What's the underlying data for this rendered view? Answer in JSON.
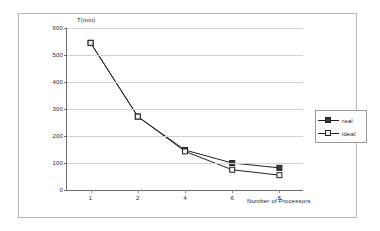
{
  "figure": {
    "border_color": "#b9b9b9",
    "background": "#ffffff"
  },
  "axes": {
    "y_title": "T(min)",
    "x_title": "Number of Processors"
  },
  "legend": {
    "position": "right",
    "entries": [
      {
        "label": "real",
        "marker": "filled-square",
        "color": "#222222",
        "fill": "#3a3a3a"
      },
      {
        "label": "ideal",
        "marker": "open-square",
        "color": "#222222",
        "fill": "#f2f2f2"
      }
    ]
  },
  "chart_data": {
    "type": "line",
    "title": "",
    "subtitle": "",
    "xlabel": "Number of Processors",
    "ylabel": "T(min)",
    "categories": [
      "1",
      "2",
      "4",
      "6",
      "8"
    ],
    "x": [
      1,
      2,
      4,
      6,
      8
    ],
    "ylim": [
      0,
      600
    ],
    "yticks": [
      0,
      100,
      200,
      300,
      400,
      500,
      600
    ],
    "ytick_labels": [
      "0",
      "100",
      "200",
      "300",
      "400",
      "500",
      "600"
    ],
    "xtick_labels": [
      "1",
      "2",
      "4",
      "6",
      "8"
    ],
    "grid": "horizontal",
    "legend_position": "right",
    "series": [
      {
        "name": "real",
        "values": [
          545,
          272,
          148,
          100,
          82
        ],
        "marker": "filled-square",
        "color": "#222222"
      },
      {
        "name": "ideal",
        "values": [
          545,
          272,
          143,
          75,
          55
        ],
        "marker": "open-square",
        "color": "#222222"
      }
    ]
  }
}
